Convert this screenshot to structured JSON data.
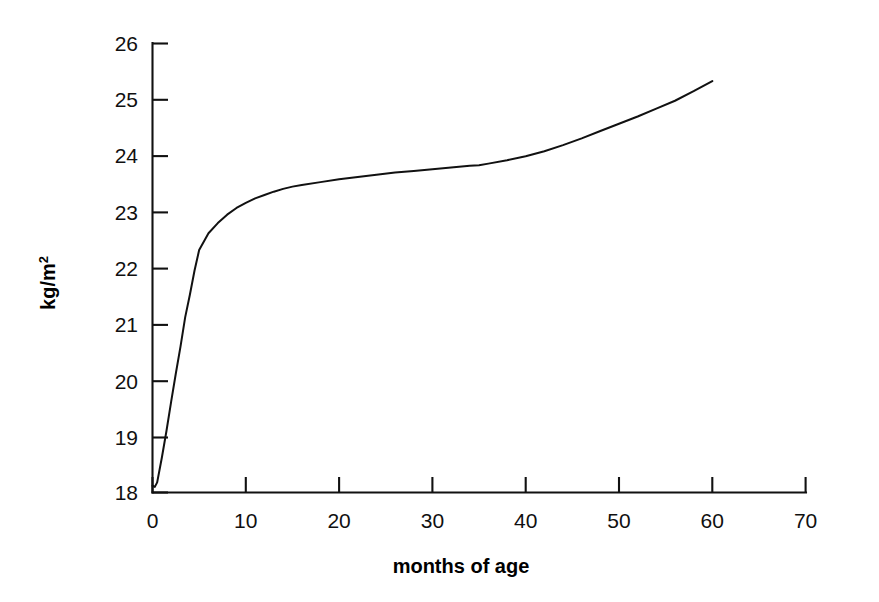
{
  "figure": {
    "background_color": "#ffffff",
    "line_color": "#111111",
    "axis_color": "#111111"
  },
  "axis_titles": {
    "x": "months of age",
    "y_base": "kg/m",
    "y_superscript": "2",
    "y_full": "kg/m²"
  },
  "ticks": {
    "x": [
      "0",
      "10",
      "20",
      "30",
      "40",
      "50",
      "60",
      "70"
    ],
    "y": [
      "18",
      "19",
      "20",
      "21",
      "22",
      "23",
      "24",
      "25",
      "26"
    ]
  },
  "chart_data": {
    "type": "line",
    "title": "",
    "subtitle": "",
    "xlabel": "months of age",
    "ylabel": "kg/m²",
    "xlim": [
      0,
      70
    ],
    "ylim": [
      18,
      26
    ],
    "xticks": [
      0,
      10,
      20,
      30,
      40,
      50,
      60,
      70
    ],
    "yticks": [
      18,
      19,
      20,
      21,
      22,
      23,
      24,
      25,
      26
    ],
    "grid": false,
    "legend": null,
    "legend_position": "none",
    "annotations": [],
    "series": [
      {
        "name": "mean BMI",
        "x": [
          0,
          0.25,
          0.5,
          1,
          1.5,
          2,
          2.5,
          3,
          3.5,
          4,
          4.5,
          5,
          6,
          7,
          8,
          9,
          10,
          11,
          12,
          13,
          14,
          15,
          16,
          18,
          20,
          22,
          24,
          26,
          28,
          30,
          32,
          34,
          35,
          36,
          38,
          40,
          42,
          44,
          46,
          48,
          50,
          52,
          54,
          56,
          58,
          60
        ],
        "y": [
          18.12,
          18.1,
          18.18,
          18.62,
          19.1,
          19.62,
          20.12,
          20.6,
          21.12,
          21.52,
          21.95,
          22.32,
          22.62,
          22.8,
          22.95,
          23.07,
          23.16,
          23.24,
          23.3,
          23.36,
          23.41,
          23.45,
          23.48,
          23.53,
          23.58,
          23.62,
          23.66,
          23.7,
          23.73,
          23.76,
          23.79,
          23.82,
          23.83,
          23.86,
          23.92,
          23.99,
          24.08,
          24.19,
          24.31,
          24.44,
          24.57,
          24.7,
          24.84,
          24.98,
          25.15,
          25.33
        ]
      }
    ]
  }
}
